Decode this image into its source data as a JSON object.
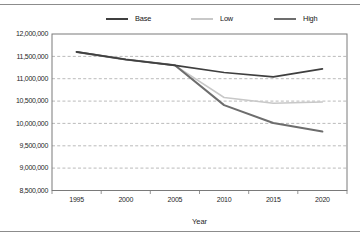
{
  "colors": {
    "background": "#ffffff",
    "rule": "#8c8c8c",
    "gridline": "#a9a9a9",
    "axis": "#7a7a7a",
    "text": "#1f1f1f"
  },
  "chart_data": {
    "type": "line",
    "title": "",
    "xlabel": "Year",
    "ylabel": "",
    "categories": [
      "1995",
      "2000",
      "2005",
      "2010",
      "2015",
      "2020"
    ],
    "ylim": [
      8500000,
      12000000
    ],
    "ytick_step": 500000,
    "ytick_labels": [
      "12,000,000",
      "11,500,000",
      "11,000,000",
      "10,500,000",
      "10,000,000",
      "9,500,000",
      "9,000,000",
      "8,500,000"
    ],
    "grid": "horizontal-dashed",
    "legend_position": "top",
    "series": [
      {
        "name": "Base",
        "color": "#3f3f3f",
        "stroke_width": 1.7,
        "values": [
          11600000,
          11430000,
          11300000,
          11140000,
          11040000,
          11220000
        ]
      },
      {
        "name": "Low",
        "color": "#c8c8c8",
        "stroke_width": 1.5,
        "values": [
          11600000,
          11430000,
          11300000,
          10580000,
          10450000,
          10480000
        ]
      },
      {
        "name": "High",
        "color": "#6d6d6d",
        "stroke_width": 2,
        "values": [
          11600000,
          11430000,
          11300000,
          10410000,
          10010000,
          9820000
        ]
      }
    ]
  }
}
